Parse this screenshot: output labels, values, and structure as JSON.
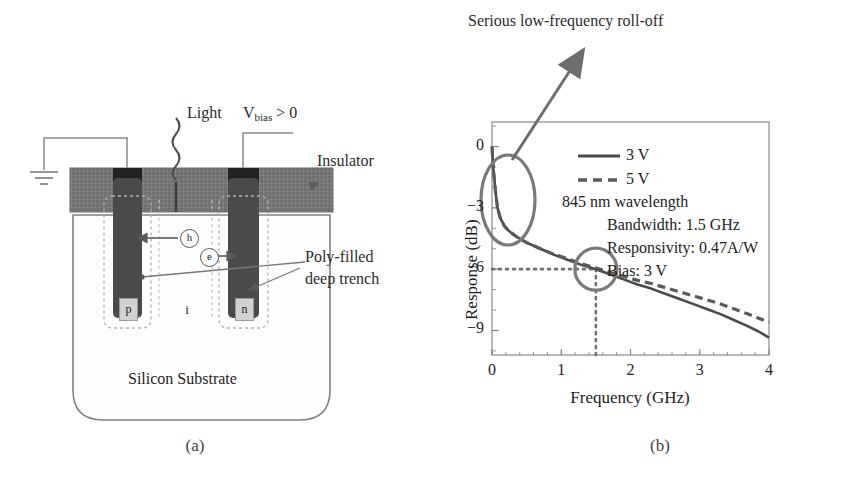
{
  "figure": {
    "caption_a": "(a)",
    "caption_b": "(b)"
  },
  "device_diagram": {
    "name": "lateral-pin-photodiode-cross-section",
    "labels": {
      "light": "Light",
      "vbias_main": "V",
      "vbias_sub": "bias",
      "vbias_tail": "> 0",
      "insulator": "Insulator",
      "poly_trench_line1": "Poly-filled",
      "poly_trench_line2": "deep trench",
      "substrate": "Silicon Substrate",
      "carrier_hole": "h",
      "carrier_electron": "e",
      "region_p": "p",
      "region_i": "i",
      "region_n": "n"
    },
    "colors": {
      "insulator_fill": "#6e6e6e",
      "contact_fill": "#2f2f2f",
      "trench_fill": "#4a4a4a",
      "doped_fill": "#d2d2d2",
      "outline": "#6b6b6b"
    }
  },
  "chart_data": {
    "type": "line",
    "title": "",
    "xlabel": "Frequency (GHz)",
    "ylabel": "Response (dB)",
    "xlim": [
      0,
      4
    ],
    "ylim": [
      -10.2,
      1.2
    ],
    "xticks": [
      0,
      1,
      2,
      3,
      4
    ],
    "xtick_labels": [
      "0",
      "1",
      "2",
      "3",
      "4"
    ],
    "yticks": [
      0,
      -3,
      -6,
      -9
    ],
    "ytick_labels": [
      "0",
      "−3",
      "−6",
      "−9"
    ],
    "grid": false,
    "legend_position": "upper-center",
    "series": [
      {
        "name": "3 V",
        "style": "solid",
        "color": "#4a4a4a",
        "x": [
          0.0,
          0.02,
          0.05,
          0.08,
          0.12,
          0.18,
          0.25,
          0.35,
          0.5,
          0.7,
          0.9,
          1.1,
          1.3,
          1.5,
          1.7,
          1.9,
          2.1,
          2.3,
          2.5,
          2.7,
          2.9,
          3.1,
          3.3,
          3.5,
          3.7,
          3.85,
          4.0
        ],
        "y": [
          0.0,
          -1.1,
          -2.2,
          -3.0,
          -3.5,
          -3.9,
          -4.15,
          -4.4,
          -4.7,
          -5.0,
          -5.3,
          -5.55,
          -5.8,
          -6.0,
          -6.25,
          -6.5,
          -6.75,
          -6.95,
          -7.2,
          -7.45,
          -7.7,
          -7.95,
          -8.2,
          -8.5,
          -8.8,
          -9.05,
          -9.35
        ]
      },
      {
        "name": "5 V",
        "style": "dashed",
        "color": "#5a5a5a",
        "x": [
          0.0,
          0.02,
          0.05,
          0.08,
          0.12,
          0.18,
          0.25,
          0.35,
          0.5,
          0.7,
          0.9,
          1.1,
          1.3,
          1.5,
          1.7,
          1.9,
          2.1,
          2.3,
          2.5,
          2.7,
          2.9,
          3.1,
          3.3,
          3.5,
          3.7,
          3.85,
          4.0
        ],
        "y": [
          0.0,
          -1.1,
          -2.2,
          -3.0,
          -3.5,
          -3.9,
          -4.15,
          -4.4,
          -4.7,
          -5.0,
          -5.28,
          -5.5,
          -5.75,
          -5.95,
          -6.15,
          -6.35,
          -6.55,
          -6.7,
          -6.9,
          -7.1,
          -7.3,
          -7.5,
          -7.7,
          -7.95,
          -8.2,
          -8.4,
          -8.6
        ]
      }
    ],
    "markers": {
      "bandwidth_point": {
        "x": 1.5,
        "y": -6.0,
        "guide_style": "dotted"
      }
    },
    "annotations": [
      {
        "name": "roll-off-callout",
        "text": "Serious low-frequency roll-off",
        "points_to": {
          "x": 0.05,
          "y": -1.5
        }
      }
    ],
    "legend": [
      {
        "label": "3 V",
        "style": "solid"
      },
      {
        "label": "5 V",
        "style": "dashed"
      }
    ],
    "info_lines": [
      "845 nm wavelength",
      "Bandwidth: 1.5 GHz",
      "Responsivity: 0.47A/W",
      "Bias: 3 V"
    ]
  }
}
